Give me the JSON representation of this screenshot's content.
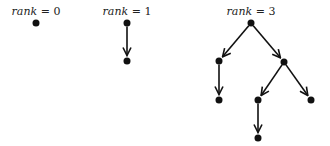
{
  "trees": [
    {
      "id": "rank0",
      "label_var": "rank",
      "label_eq": " = ",
      "label_val": "0",
      "label_x": 36,
      "label_y": 15,
      "nodes": [
        {
          "id": "r0n0",
          "x": 36,
          "y": 23
        }
      ],
      "edges": []
    },
    {
      "id": "rank1",
      "label_var": "rank",
      "label_eq": " = ",
      "label_val": "1",
      "label_x": 127,
      "label_y": 15,
      "nodes": [
        {
          "id": "r1n0",
          "x": 127,
          "y": 23
        },
        {
          "id": "r1n1",
          "x": 127,
          "y": 61
        }
      ],
      "edges": [
        {
          "from": "r1n0",
          "to": "r1n1"
        }
      ]
    },
    {
      "id": "rank3",
      "label_var": "rank",
      "label_eq": " = ",
      "label_val": "3",
      "label_x": 251,
      "label_y": 15,
      "nodes": [
        {
          "id": "r3n0",
          "x": 251,
          "y": 23
        },
        {
          "id": "r3n1",
          "x": 219,
          "y": 61
        },
        {
          "id": "r3n2",
          "x": 219,
          "y": 100
        },
        {
          "id": "r3n3",
          "x": 284,
          "y": 62
        },
        {
          "id": "r3n4",
          "x": 258,
          "y": 100
        },
        {
          "id": "r3n5",
          "x": 311,
          "y": 100
        },
        {
          "id": "r3n6",
          "x": 258,
          "y": 138
        }
      ],
      "edges": [
        {
          "from": "r3n0",
          "to": "r3n1"
        },
        {
          "from": "r3n1",
          "to": "r3n2"
        },
        {
          "from": "r3n0",
          "to": "r3n3"
        },
        {
          "from": "r3n3",
          "to": "r3n4"
        },
        {
          "from": "r3n3",
          "to": "r3n5"
        },
        {
          "from": "r3n4",
          "to": "r3n6"
        }
      ]
    }
  ],
  "style": {
    "node_color": "#111111",
    "edge_color": "#111111",
    "node_radius": 3.5
  }
}
